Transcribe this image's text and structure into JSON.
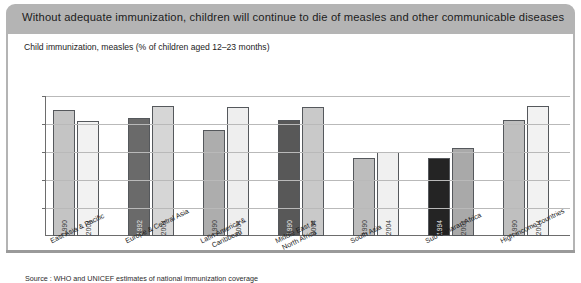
{
  "header": {
    "title": "Without adequate immunization, children will continue to die of measles and other communicable diseases",
    "band_color": "#b4b4b4"
  },
  "subtitle": "Child immunization, measles (% of children aged 12–23 months)",
  "source": "Source : WHO and UNICEF estimates of national immunization coverage",
  "chart_data": {
    "type": "bar",
    "title": "Child immunization, measles (% of children aged 12–23 months)",
    "xlabel": "",
    "ylabel": "",
    "ylim": [
      0,
      100
    ],
    "yticks": [
      0,
      20,
      40,
      60,
      80,
      100
    ],
    "ytick_labels": [
      "0",
      "20",
      "40",
      "60",
      "80",
      "100"
    ],
    "grid": true,
    "legend": "none",
    "categories": [
      "East Asia & Pacific",
      "Europe & Central Asia",
      "Latin America &\nCaribbean",
      "Middle East &\nNorth Africa",
      "South Asia",
      "Sub-Saharan Africa",
      "High-income countries"
    ],
    "bars": [
      {
        "category": "East Asia & Pacific",
        "year": "1990",
        "value": 90,
        "color": "#c4c4c4"
      },
      {
        "category": "East Asia & Pacific",
        "year": "2004",
        "value": 82,
        "color": "#f2f2f2"
      },
      {
        "category": "Europe & Central Asia",
        "year": "1992",
        "value": 84,
        "color": "#6a6a6a"
      },
      {
        "category": "Europe & Central Asia",
        "year": "2004",
        "value": 93,
        "color": "#d6d6d6"
      },
      {
        "category": "Latin America & Caribbean",
        "year": "1990",
        "value": 76,
        "color": "#adadad"
      },
      {
        "category": "Latin America & Caribbean",
        "year": "2004",
        "value": 92,
        "color": "#eeeeee"
      },
      {
        "category": "Middle East & North Africa",
        "year": "1990",
        "value": 83,
        "color": "#585858"
      },
      {
        "category": "Middle East & North Africa",
        "year": "2004",
        "value": 92,
        "color": "#c9c9c9"
      },
      {
        "category": "South Asia",
        "year": "1990",
        "value": 56,
        "color": "#bdbdbd"
      },
      {
        "category": "South Asia",
        "year": "2004",
        "value": 60,
        "color": "#f0f0f0"
      },
      {
        "category": "Sub-Saharan Africa",
        "year": "1994",
        "value": 56,
        "color": "#242424"
      },
      {
        "category": "Sub-Saharan Africa",
        "year": "2004",
        "value": 63,
        "color": "#a9a9a9"
      },
      {
        "category": "High-income countries",
        "year": "1990",
        "value": 83,
        "color": "#bfbfbf"
      },
      {
        "category": "High-income countries",
        "year": "2004",
        "value": 93,
        "color": "#f2f2f2"
      }
    ]
  }
}
